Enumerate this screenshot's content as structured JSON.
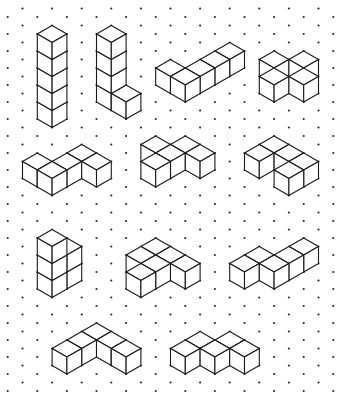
{
  "canvas": {
    "width": 342,
    "height": 408,
    "background": "#ffffff"
  },
  "grid": {
    "origin_x": 22.5,
    "origin_y": 25.5,
    "col_step": 14.8,
    "row_step": 8.5,
    "cols": 21,
    "rows": 44,
    "dot_radius": 1.1,
    "dot_color": "#2a2a2a"
  },
  "style": {
    "line_color": "#1a1a1a",
    "face_fill": "#ffffff"
  },
  "figures": [
    {
      "name": "tower-five",
      "cubes": [
        [
          2,
          16
        ],
        [
          2,
          14
        ],
        [
          2,
          12
        ],
        [
          2,
          10
        ],
        [
          2,
          8
        ]
      ],
      "stack": [
        0,
        1,
        2,
        3,
        4
      ],
      "base": [
        2,
        8
      ]
    },
    {
      "name": "tower-with-foot",
      "cubes": [
        [
          6,
          6,
          0
        ],
        [
          7,
          7,
          0
        ],
        [
          6,
          6,
          1
        ],
        [
          6,
          6,
          2
        ],
        [
          6,
          6,
          3
        ]
      ]
    },
    {
      "name": "long-l-flat",
      "cubes": [
        [
          10,
          4,
          0
        ],
        [
          14,
          2,
          0
        ],
        [
          13,
          3,
          0
        ],
        [
          12,
          4,
          0
        ],
        [
          11,
          5,
          0
        ]
      ]
    },
    {
      "name": "square-block",
      "cubes": [
        [
          17,
          3,
          0
        ],
        [
          19,
          3,
          0
        ],
        [
          17,
          5,
          0
        ],
        [
          19,
          5,
          0
        ]
      ]
    },
    {
      "name": "s-shape-flat",
      "cubes": [
        [
          4,
          14,
          0
        ],
        [
          1,
          15,
          0
        ],
        [
          3,
          15,
          0
        ],
        [
          5,
          15,
          0
        ],
        [
          2,
          16,
          0
        ]
      ]
    },
    {
      "name": "t-cluster-flat",
      "cubes": [
        [
          9,
          13,
          0
        ],
        [
          11,
          13,
          0
        ],
        [
          10,
          14,
          0
        ],
        [
          12,
          14,
          0
        ],
        [
          9,
          15,
          0
        ]
      ]
    },
    {
      "name": "hook-flat",
      "cubes": [
        [
          17,
          13,
          0
        ],
        [
          16,
          14,
          0
        ],
        [
          18,
          14,
          0
        ],
        [
          19,
          15,
          0
        ],
        [
          18,
          16,
          0
        ]
      ]
    },
    {
      "name": "column-pair",
      "cubes": [
        [
          3,
          27,
          0
        ],
        [
          3,
          27,
          1
        ],
        [
          2,
          28,
          0
        ],
        [
          2,
          28,
          1
        ],
        [
          2,
          28,
          2
        ]
      ]
    },
    {
      "name": "step-cluster",
      "cubes": [
        [
          9,
          25,
          0
        ],
        [
          8,
          26,
          0
        ],
        [
          10,
          26,
          0
        ],
        [
          9,
          27,
          0
        ],
        [
          11,
          27,
          0
        ],
        [
          8,
          28,
          0
        ]
      ]
    },
    {
      "name": "zigzag-row",
      "cubes": [
        [
          19,
          25,
          0
        ],
        [
          16,
          26,
          0
        ],
        [
          18,
          26,
          0
        ],
        [
          15,
          27,
          0
        ],
        [
          17,
          27,
          0
        ]
      ]
    },
    {
      "name": "v-shape-flat",
      "cubes": [
        [
          5,
          35,
          0
        ],
        [
          4,
          36,
          0
        ],
        [
          6,
          36,
          0
        ],
        [
          3,
          37,
          0
        ],
        [
          7,
          37,
          0
        ]
      ]
    },
    {
      "name": "w-row-flat",
      "cubes": [
        [
          12,
          36,
          0
        ],
        [
          14,
          36,
          0
        ],
        [
          11,
          37,
          0
        ],
        [
          13,
          37,
          0
        ],
        [
          15,
          37,
          0
        ]
      ]
    }
  ]
}
